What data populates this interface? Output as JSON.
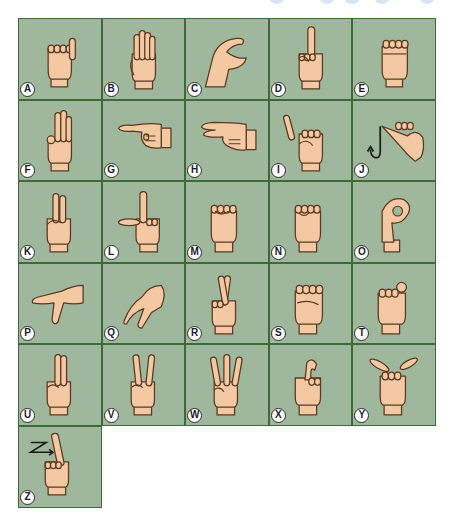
{
  "chart": {
    "title": "",
    "colors": {
      "cell_background": "#9fb79c",
      "grid_line": "#3d6a38",
      "skin": "#f3c8a2",
      "outline": "#5a3a22",
      "label_bg": "#ffffff",
      "label_text": "#1b1b2b",
      "arrow": "#1b1b1b"
    },
    "cells": [
      {
        "letter": "A",
        "handshape": "fist-thumb-side",
        "row": 0,
        "col": 0
      },
      {
        "letter": "B",
        "handshape": "flat-fingers-up",
        "row": 0,
        "col": 1
      },
      {
        "letter": "C",
        "handshape": "curved-c",
        "row": 0,
        "col": 2
      },
      {
        "letter": "D",
        "handshape": "index-up",
        "row": 0,
        "col": 3
      },
      {
        "letter": "E",
        "handshape": "fingers-curled",
        "row": 0,
        "col": 4
      },
      {
        "letter": "F",
        "handshape": "three-up-ok",
        "row": 1,
        "col": 0
      },
      {
        "letter": "G",
        "handshape": "index-pointing-left",
        "row": 1,
        "col": 1
      },
      {
        "letter": "H",
        "handshape": "two-pointing-left",
        "row": 1,
        "col": 2
      },
      {
        "letter": "I",
        "handshape": "pinky-up",
        "row": 1,
        "col": 3
      },
      {
        "letter": "J",
        "handshape": "pinky-hook-motion",
        "row": 1,
        "col": 4
      },
      {
        "letter": "K",
        "handshape": "two-up-thumb-between",
        "row": 2,
        "col": 0
      },
      {
        "letter": "L",
        "handshape": "l-shape",
        "row": 2,
        "col": 1
      },
      {
        "letter": "M",
        "handshape": "fist-three-over-thumb",
        "row": 2,
        "col": 2
      },
      {
        "letter": "N",
        "handshape": "fist-two-over-thumb",
        "row": 2,
        "col": 3
      },
      {
        "letter": "O",
        "handshape": "o-shape",
        "row": 2,
        "col": 4
      },
      {
        "letter": "P",
        "handshape": "k-pointing-down",
        "row": 3,
        "col": 0
      },
      {
        "letter": "Q",
        "handshape": "g-pointing-down",
        "row": 3,
        "col": 1
      },
      {
        "letter": "R",
        "handshape": "crossed-fingers",
        "row": 3,
        "col": 2
      },
      {
        "letter": "S",
        "handshape": "fist-thumb-front",
        "row": 3,
        "col": 3
      },
      {
        "letter": "T",
        "handshape": "thumb-between-index",
        "row": 3,
        "col": 4
      },
      {
        "letter": "U",
        "handshape": "two-up-together",
        "row": 4,
        "col": 0
      },
      {
        "letter": "V",
        "handshape": "two-up-apart",
        "row": 4,
        "col": 1
      },
      {
        "letter": "W",
        "handshape": "three-up-apart",
        "row": 4,
        "col": 2
      },
      {
        "letter": "X",
        "handshape": "index-hooked",
        "row": 4,
        "col": 3
      },
      {
        "letter": "Y",
        "handshape": "thumb-pinky-out",
        "row": 4,
        "col": 4
      },
      {
        "letter": "Z",
        "handshape": "index-up-z-motion",
        "row": 5,
        "col": 0
      }
    ]
  }
}
